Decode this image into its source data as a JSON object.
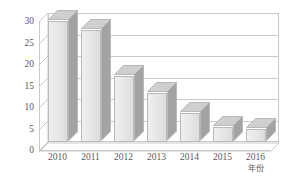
{
  "chart_data": {
    "type": "bar",
    "title": "",
    "subtitle": "",
    "xlabel": "年份",
    "ylabel": "识别错误率/%",
    "categories": [
      "2010",
      "2011",
      "2012",
      "2013",
      "2014",
      "2015",
      "2016"
    ],
    "values": [
      28.2,
      26.0,
      15.3,
      11.3,
      6.7,
      3.6,
      3.0
    ],
    "series": [
      {
        "name": "识别错误率",
        "values": [
          28.2,
          26.0,
          15.3,
          11.3,
          6.7,
          3.6,
          3.0
        ]
      }
    ],
    "ylim": [
      0,
      30
    ],
    "xlim_categories": 7,
    "y_ticks": [
      "0",
      "5",
      "10",
      "15",
      "20",
      "25",
      "30"
    ],
    "y_tick_values": [
      0,
      5,
      10,
      15,
      20,
      25,
      30
    ],
    "x_ticks": [
      "2010",
      "2011",
      "2012",
      "2013",
      "2014",
      "2015",
      "2016"
    ],
    "grid": true,
    "grid_axis": "y",
    "legend": false,
    "legend_position": "none",
    "style": "3d-column",
    "annotations": []
  },
  "colors": {
    "background": "#ffffff",
    "bar_face": "#e7e7e7",
    "bar_side": "#a3a3a3",
    "bar_top": "#cfcfcf",
    "bar_outline": "#b9b9b9",
    "gridline": "#c9c9c9",
    "axis": "#c9c9c9",
    "tick_text": "#58595d",
    "axis_title_text": "#5a5b5f"
  }
}
